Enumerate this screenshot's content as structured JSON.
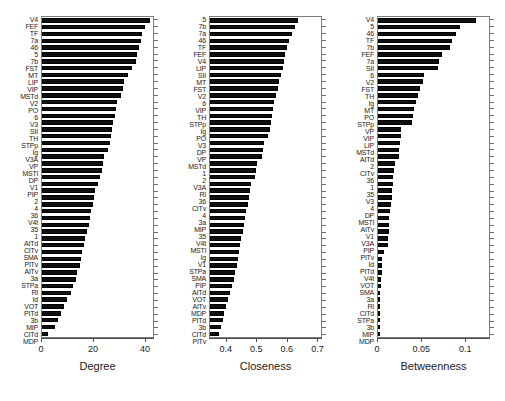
{
  "figure": {
    "title": "",
    "background": "#ffffff",
    "bar_color": "#101010",
    "axis_color": "#4a4a4a",
    "panel_count": 3
  },
  "chart_data": [
    {
      "type": "bar",
      "orientation": "horizontal",
      "title": "",
      "xlabel": "Degree",
      "ylabel": "",
      "xlim": [
        0,
        43.5
      ],
      "xticks": [
        0,
        20,
        40
      ],
      "xticklabels": [
        "0",
        "20",
        "40"
      ],
      "grid": false,
      "legend": false,
      "categories": [
        "V4",
        "FEF",
        "TF",
        "7a",
        "46",
        "5",
        "7b",
        "FST",
        "MT",
        "LIP",
        "VIP",
        "MSTd",
        "V2",
        "PO",
        "6",
        "V3",
        "SII",
        "TH",
        "STPp",
        "Ig",
        "V3A",
        "VP",
        "MSTl",
        "DP",
        "V1",
        "PIP",
        "2",
        "4",
        "36",
        "V4t",
        "35",
        "1",
        "AITd",
        "CITv",
        "SMA",
        "PITv",
        "AITv",
        "3a",
        "STPa",
        "RI",
        "Id",
        "VOT",
        "PITd",
        "3b",
        "MIP",
        "CITd",
        "MDP"
      ],
      "values": [
        41.5,
        39.5,
        38.5,
        38.0,
        37.5,
        36.5,
        36.0,
        34.5,
        33.0,
        31.5,
        31.0,
        30.5,
        29.0,
        28.5,
        28.0,
        27.5,
        27.0,
        26.5,
        26.0,
        25.5,
        24.0,
        23.5,
        23.0,
        22.5,
        21.5,
        20.5,
        20.0,
        19.5,
        19.0,
        18.5,
        18.0,
        17.5,
        16.5,
        16.0,
        15.5,
        15.0,
        14.5,
        13.5,
        13.0,
        12.0,
        11.0,
        9.5,
        8.5,
        7.5,
        6.0,
        5.0,
        2.5
      ]
    },
    {
      "type": "bar",
      "orientation": "horizontal",
      "title": "",
      "xlabel": "Closeness",
      "ylabel": "",
      "xlim": [
        0.345,
        0.715
      ],
      "xticks": [
        0.4,
        0.5,
        0.6,
        0.7
      ],
      "xticklabels": [
        "0.4",
        "0.5",
        "0.6",
        "0.7"
      ],
      "grid": false,
      "legend": false,
      "categories": [
        "5",
        "7b",
        "7a",
        "46",
        "TF",
        "FEF",
        "V4",
        "LIP",
        "SII",
        "MT",
        "FST",
        "V2",
        "6",
        "VIP",
        "TH",
        "STPp",
        "Ig",
        "PO",
        "V3",
        "DP",
        "VP",
        "MSTd",
        "1",
        "2",
        "V3A",
        "RI",
        "36",
        "CITv",
        "4",
        "3a",
        "MIP",
        "35",
        "V4t",
        "MSTl",
        "Ig2",
        "V1",
        "STPa",
        "SMA",
        "PIP",
        "AITd",
        "VOT",
        "AITv",
        "MDP",
        "PITd",
        "3b",
        "CITd",
        "PITv"
      ],
      "values": [
        0.632,
        0.623,
        0.613,
        0.605,
        0.598,
        0.592,
        0.588,
        0.583,
        0.578,
        0.572,
        0.568,
        0.56,
        0.556,
        0.552,
        0.548,
        0.544,
        0.54,
        0.536,
        0.522,
        0.518,
        0.514,
        0.5,
        0.496,
        0.492,
        0.48,
        0.476,
        0.472,
        0.468,
        0.464,
        0.46,
        0.456,
        0.452,
        0.448,
        0.444,
        0.44,
        0.436,
        0.432,
        0.428,
        0.424,
        0.418,
        0.41,
        0.404,
        0.398,
        0.392,
        0.386,
        0.38,
        0.374
      ]
    },
    {
      "type": "bar",
      "orientation": "horizontal",
      "title": "",
      "xlabel": "Betweenness",
      "ylabel": "",
      "xlim": [
        0,
        0.128
      ],
      "xticks": [
        0,
        0.05,
        0.1
      ],
      "xticklabels": [
        "0",
        "0.05",
        "0.1"
      ],
      "grid": false,
      "legend": false,
      "categories": [
        "V4",
        "5",
        "46",
        "TF",
        "7b",
        "FEF",
        "7a",
        "SII",
        "6",
        "V2",
        "FST",
        "TH",
        "Ig",
        "MT",
        "PO",
        "STPp",
        "VP",
        "VIP",
        "LIP",
        "MSTd",
        "AITd",
        "2",
        "CITv",
        "36",
        "1",
        "35",
        "V3",
        "4",
        "DP",
        "MSTl",
        "AITv",
        "V1",
        "V3A",
        "PIP",
        "PITv",
        "Id",
        "PITd",
        "V4t",
        "VOT",
        "SMA",
        "3a",
        "RI",
        "CITd",
        "STPa",
        "3b",
        "MIP",
        "MDP"
      ],
      "values": [
        0.1105,
        0.0925,
        0.088,
        0.084,
        0.081,
        0.072,
        0.0695,
        0.068,
        0.0525,
        0.0505,
        0.048,
        0.0455,
        0.0435,
        0.041,
        0.04,
        0.0385,
        0.0265,
        0.0255,
        0.025,
        0.024,
        0.0235,
        0.0195,
        0.0185,
        0.0175,
        0.0165,
        0.016,
        0.0155,
        0.015,
        0.014,
        0.013,
        0.0125,
        0.012,
        0.0115,
        0.011,
        0.0065,
        0.005,
        0.0045,
        0.004,
        0.0035,
        0.003,
        0.0025,
        0.0022,
        0.0018,
        0.0015,
        0.001,
        0.0006,
        0.0003
      ]
    }
  ]
}
